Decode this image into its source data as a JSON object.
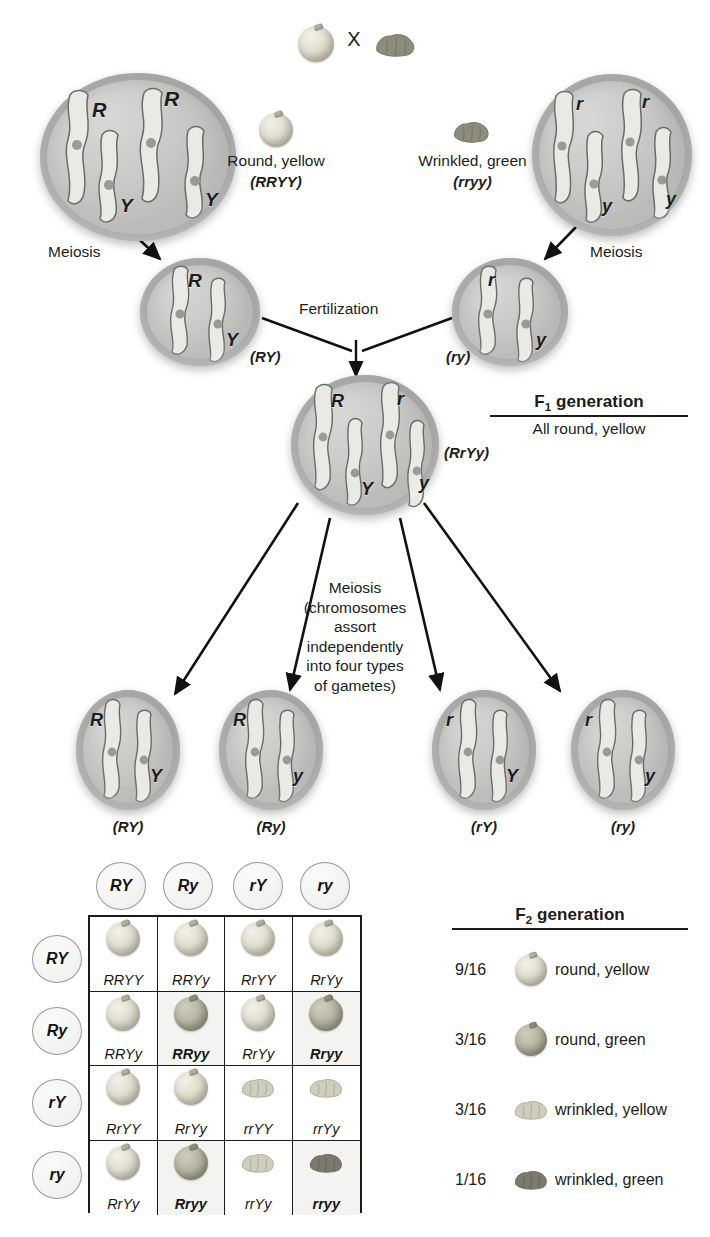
{
  "cross": {
    "operator": "X",
    "parent_left": {
      "label": "Round, yellow",
      "genotype": "(RRYY)"
    },
    "parent_right": {
      "label": "Wrinkled, green",
      "genotype": "(rryy)"
    }
  },
  "parent_cells": {
    "left": {
      "alleles": [
        "R",
        "R",
        "Y",
        "Y"
      ],
      "meiosis_label": "Meiosis"
    },
    "right": {
      "alleles": [
        "r",
        "r",
        "y",
        "y"
      ],
      "meiosis_label": "Meiosis"
    }
  },
  "parent_gametes": {
    "left": {
      "alleles": [
        "R",
        "Y"
      ],
      "label": "(RY)"
    },
    "right": {
      "alleles": [
        "r",
        "y"
      ],
      "label": "(ry)"
    },
    "fertilization_label": "Fertilization"
  },
  "f1": {
    "cell": {
      "alleles": [
        "R",
        "r",
        "Y",
        "y"
      ],
      "label": "(RrYy)"
    },
    "title": "F",
    "title_sub": "1",
    "title_rest": " generation",
    "description": "All round, yellow"
  },
  "meiosis_note": [
    "Meiosis",
    "(chromosomes",
    "assort",
    "independently",
    "into four types",
    "of gametes)"
  ],
  "f1_gametes": [
    {
      "alleles": [
        "R",
        "Y"
      ],
      "label": "(RY)"
    },
    {
      "alleles": [
        "R",
        "y"
      ],
      "label": "(Ry)"
    },
    {
      "alleles": [
        "r",
        "Y"
      ],
      "label": "(rY)"
    },
    {
      "alleles": [
        "r",
        "y"
      ],
      "label": "(ry)"
    }
  ],
  "punnett": {
    "col_headers": [
      "RY",
      "Ry",
      "rY",
      "ry"
    ],
    "row_headers": [
      "RY",
      "Ry",
      "rY",
      "ry"
    ],
    "rows": [
      [
        {
          "genotype": "RRYY",
          "phenotype": "round-yellow",
          "bold": false,
          "shaded": false
        },
        {
          "genotype": "RRYy",
          "phenotype": "round-yellow",
          "bold": false,
          "shaded": false
        },
        {
          "genotype": "RrYY",
          "phenotype": "round-yellow",
          "bold": false,
          "shaded": false
        },
        {
          "genotype": "RrYy",
          "phenotype": "round-yellow",
          "bold": false,
          "shaded": false
        }
      ],
      [
        {
          "genotype": "RRYy",
          "phenotype": "round-yellow",
          "bold": false,
          "shaded": false
        },
        {
          "genotype": "RRyy",
          "phenotype": "round-green",
          "bold": true,
          "shaded": true
        },
        {
          "genotype": "RrYy",
          "phenotype": "round-yellow",
          "bold": false,
          "shaded": false
        },
        {
          "genotype": "Rryy",
          "phenotype": "round-green",
          "bold": true,
          "shaded": true
        }
      ],
      [
        {
          "genotype": "RrYY",
          "phenotype": "round-yellow",
          "bold": false,
          "shaded": false
        },
        {
          "genotype": "RrYy",
          "phenotype": "round-yellow",
          "bold": false,
          "shaded": false
        },
        {
          "genotype": "rrYY",
          "phenotype": "wrinkled-yellow",
          "bold": false,
          "shaded": false
        },
        {
          "genotype": "rrYy",
          "phenotype": "wrinkled-yellow",
          "bold": false,
          "shaded": false
        }
      ],
      [
        {
          "genotype": "RrYy",
          "phenotype": "round-yellow",
          "bold": false,
          "shaded": false
        },
        {
          "genotype": "Rryy",
          "phenotype": "round-green",
          "bold": true,
          "shaded": true
        },
        {
          "genotype": "rrYy",
          "phenotype": "wrinkled-yellow",
          "bold": false,
          "shaded": false
        },
        {
          "genotype": "rryy",
          "phenotype": "wrinkled-green",
          "bold": true,
          "shaded": true
        }
      ]
    ]
  },
  "f2": {
    "title": "F",
    "title_sub": "2",
    "title_rest": " generation",
    "rows": [
      {
        "fraction": "9/16",
        "phenotype": "round-yellow",
        "text": "round, yellow"
      },
      {
        "fraction": "3/16",
        "phenotype": "round-green",
        "text": "round, green"
      },
      {
        "fraction": "3/16",
        "phenotype": "wrinkled-yellow",
        "text": "wrinkled, yellow"
      },
      {
        "fraction": "1/16",
        "phenotype": "wrinkled-green",
        "text": "wrinkled, green"
      }
    ]
  },
  "colors": {
    "ink": "#1b1b1b",
    "cell_body": "#c9c9c7",
    "cell_rim": "#969694",
    "seed_yellow": "#e2e0d3",
    "seed_green": "#8e8c7c",
    "grid_line": "#1b1b1b"
  }
}
